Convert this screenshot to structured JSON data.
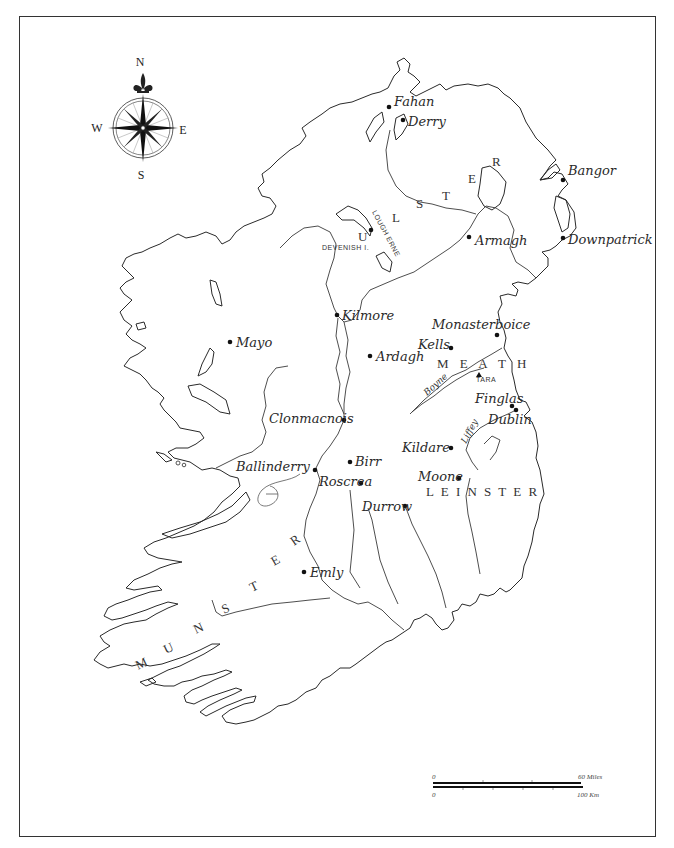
{
  "map": {
    "compass": {
      "north": "N",
      "south": "S",
      "east": "E",
      "west": "W"
    },
    "provinces": [
      {
        "name": "ULSTER",
        "letters": [
          "U",
          "L",
          "S",
          "T",
          "E",
          "R"
        ]
      },
      {
        "name": "MEATH",
        "label": "M E A T H"
      },
      {
        "name": "LEINSTER",
        "label": "L E I N S T E R"
      },
      {
        "name": "MUNSTER",
        "letters": [
          "M",
          "U",
          "N",
          "S",
          "T",
          "E",
          "R"
        ]
      }
    ],
    "sites": [
      {
        "name": "Fahan",
        "x": 389,
        "y": 107
      },
      {
        "name": "Derry",
        "x": 403,
        "y": 120
      },
      {
        "name": "Bangor",
        "x": 563,
        "y": 180
      },
      {
        "name": "Armagh",
        "x": 469,
        "y": 237
      },
      {
        "name": "Downpatrick",
        "x": 563,
        "y": 238
      },
      {
        "name": "Devenish I.",
        "x": 371,
        "y": 230
      },
      {
        "name": "Kilmore",
        "x": 337,
        "y": 315
      },
      {
        "name": "Monasterboice",
        "x": 497,
        "y": 335
      },
      {
        "name": "Kells",
        "x": 451,
        "y": 348
      },
      {
        "name": "Ardagh",
        "x": 370,
        "y": 356
      },
      {
        "name": "Mayo",
        "x": 230,
        "y": 342
      },
      {
        "name": "Clonmacnois",
        "x": 344,
        "y": 420
      },
      {
        "name": "Finglas",
        "x": 512,
        "y": 406
      },
      {
        "name": "Dublin",
        "x": 516,
        "y": 408
      },
      {
        "name": "Kildare",
        "x": 451,
        "y": 448
      },
      {
        "name": "Ballinderry",
        "x": 315,
        "y": 470
      },
      {
        "name": "Birr",
        "x": 350,
        "y": 462
      },
      {
        "name": "Roscrea",
        "x": 361,
        "y": 483
      },
      {
        "name": "Moone",
        "x": 459,
        "y": 478
      },
      {
        "name": "Durrow",
        "x": 405,
        "y": 506
      },
      {
        "name": "Emly",
        "x": 304,
        "y": 572
      }
    ],
    "features": {
      "lough_erne": "LOUGH ERNE",
      "devenish": "DEVENISH I.",
      "tara": "TARA",
      "boyne": "Boyne",
      "liffey": "Liffey"
    },
    "scale_bar": {
      "miles_start": "0",
      "miles_end": "60 Miles",
      "km_start": "0",
      "km_end": "100 Km"
    },
    "colors": {
      "ink": "#2a2a2a",
      "paper": "#ffffff",
      "frame": "#333333"
    }
  }
}
